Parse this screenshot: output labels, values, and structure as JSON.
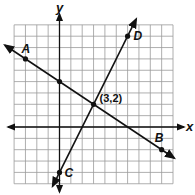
{
  "diagram": {
    "type": "coordinate-plane",
    "grid": {
      "x_min": -4,
      "x_max": 10,
      "y_min": -5,
      "y_max": 9,
      "unit_px": 11.35,
      "origin_px": [
        59.5,
        127
      ]
    },
    "axes": {
      "x_label": "x",
      "y_label": "y"
    },
    "lines": [
      {
        "name": "AB",
        "through": [
          "A",
          "B"
        ],
        "slope": "-2/3",
        "y_intercept": 4
      },
      {
        "name": "CD",
        "through": [
          "C",
          "D"
        ],
        "slope": "2",
        "y_intercept": -4
      }
    ],
    "points": [
      {
        "label": "A",
        "x": -3,
        "y": 6,
        "show_label": true
      },
      {
        "label": "B",
        "x": 9,
        "y": -2,
        "show_label": true
      },
      {
        "label": "C",
        "x": 0,
        "y": -4,
        "show_label": true
      },
      {
        "label": "D",
        "x": 6,
        "y": 8,
        "show_label": true
      },
      {
        "label": "",
        "x": 0,
        "y": 4,
        "show_label": false
      },
      {
        "label": "(3,2)",
        "x": 3,
        "y": 2,
        "show_label": true
      }
    ],
    "intersection_label": "(3,2)"
  }
}
